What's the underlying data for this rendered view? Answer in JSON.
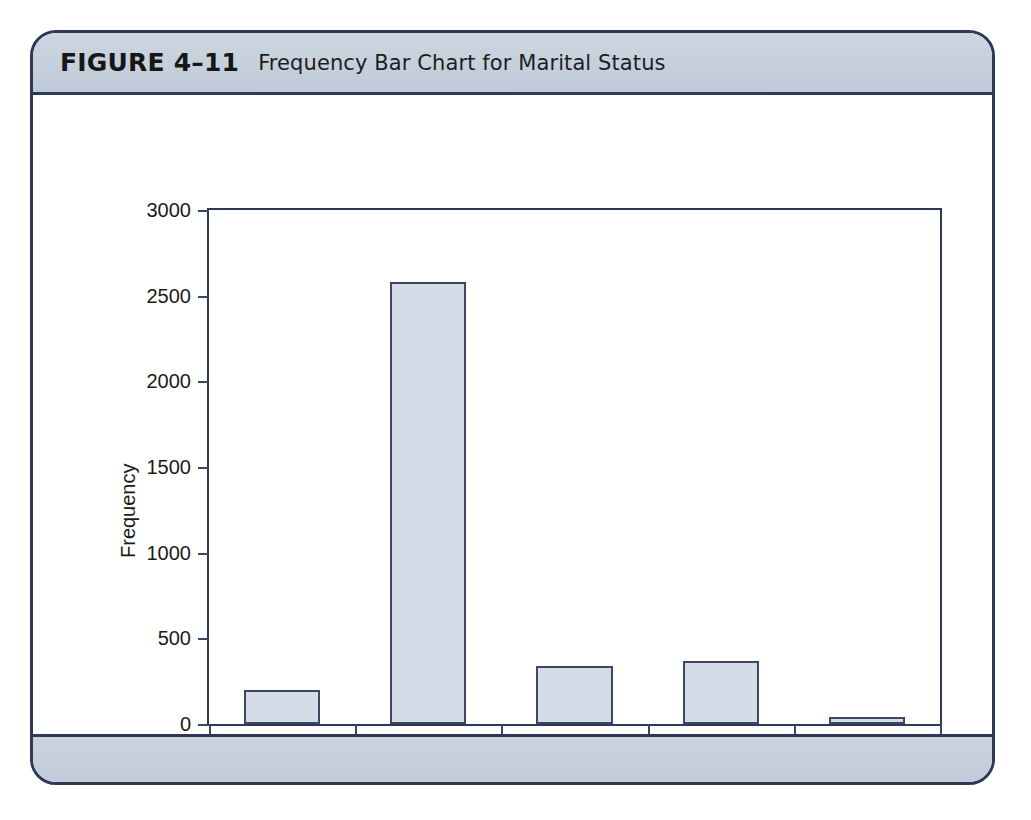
{
  "figure": {
    "number": "FIGURE 4–11",
    "caption": "Frequency Bar Chart for Marital Status"
  },
  "colors": {
    "frame_border": "#2e3a55",
    "band_background": "#c6d0dc",
    "bar_fill": "#d4dce7",
    "bar_border": "#3b4764",
    "axis": "#3b4764",
    "text": "#1b1b1b"
  },
  "chart_data": {
    "type": "bar",
    "title": "Frequency Bar Chart for Marital Status",
    "xlabel": "Marital Status",
    "ylabel": "Frequency",
    "categories": [
      "Single",
      "Married",
      "Widowed",
      "Divorced",
      "Separated"
    ],
    "values": [
      200,
      2580,
      340,
      370,
      40
    ],
    "ylim": [
      0,
      3000
    ],
    "ytick_values": [
      0,
      500,
      1000,
      1500,
      2000,
      2500,
      3000
    ],
    "ytick_labels": [
      "0",
      "500",
      "1000",
      "1500",
      "2000",
      "2500",
      "3000"
    ],
    "grid": false,
    "legend": false
  }
}
